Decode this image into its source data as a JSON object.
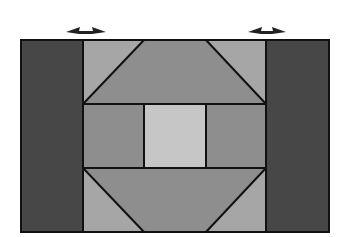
{
  "diagram": {
    "title": "",
    "colors": {
      "background": "#ffffff",
      "outline": "#111111",
      "dark_column": "#474747",
      "medium_panel": "#8e8e8e",
      "light_triangle": "#a6a6a6",
      "center_square": "#c6c6c6"
    },
    "arrows": [
      {
        "id": "left-arrow",
        "cx": 86,
        "y": 31,
        "type": "double-headed-horizontal"
      },
      {
        "id": "right-arrow",
        "cx": 266,
        "y": 31,
        "type": "double-headed-horizontal"
      }
    ],
    "frame": {
      "x": 21,
      "y": 40,
      "width": 308,
      "height": 192
    },
    "columns": [
      {
        "name": "left-dark-column",
        "x0": 21,
        "x1": 83
      },
      {
        "name": "center-region",
        "x0": 83,
        "x1": 266
      },
      {
        "name": "right-dark-column",
        "x0": 266,
        "x1": 329
      }
    ],
    "rows": [
      {
        "name": "top-band",
        "y0": 40,
        "y1": 104
      },
      {
        "name": "middle-band",
        "y0": 104,
        "y1": 168
      },
      {
        "name": "bottom-band",
        "y0": 168,
        "y1": 232
      }
    ],
    "middle_splits": [
      144,
      206
    ]
  }
}
